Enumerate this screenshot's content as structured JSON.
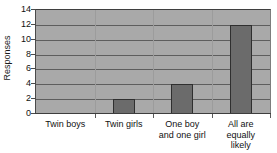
{
  "chart_data": {
    "type": "bar",
    "title": "",
    "subtitle": "",
    "xlabel": "",
    "ylabel": "Responses",
    "categories": [
      "Twin boys",
      "Twin girls",
      "One boy\nand one girl",
      "All are\nequally\nlikely"
    ],
    "values": [
      0,
      2,
      4,
      12
    ],
    "ylim": [
      0,
      14
    ],
    "ytick_values": [
      0,
      2,
      4,
      6,
      8,
      10,
      12,
      14
    ],
    "ytick_labels": [
      "0",
      "2",
      "4",
      "6",
      "8",
      "10",
      "12",
      "14"
    ],
    "grid": true,
    "grid_axis": "y",
    "legend": false,
    "legend_position": "none",
    "series": [
      {
        "name": "Responses",
        "values": [
          0,
          2,
          4,
          12
        ]
      }
    ]
  },
  "style": {
    "plot_background": "#a9a9a9",
    "bar_fill": "#6b6b6b",
    "bar_border": "#2f2f2f",
    "gridline_color": "#5e5e5e",
    "axis_color": "#3d3d3d",
    "text_color": "#111111",
    "page_background": "#ffffff"
  }
}
